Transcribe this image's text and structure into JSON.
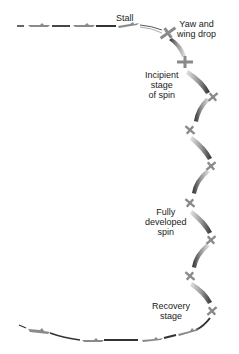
{
  "diagram": {
    "labels": {
      "stall": "Stall",
      "yaw": [
        "Yaw and",
        "wing drop"
      ],
      "incipient": [
        "Incipient",
        "stage",
        "of spin"
      ],
      "fully": [
        "Fully",
        "developed",
        "spin"
      ],
      "recovery": [
        "Recovery",
        "stage"
      ]
    },
    "colors": {
      "background": "#ffffff",
      "ribbon_dark": "#3a3a3a",
      "ribbon_light": "#d8d8d8",
      "aircraft": "#8a8a8a",
      "text": "#222222"
    },
    "stages": [
      "Stall",
      "Yaw and wing drop",
      "Incipient stage of spin",
      "Fully developed spin",
      "Recovery stage"
    ]
  }
}
